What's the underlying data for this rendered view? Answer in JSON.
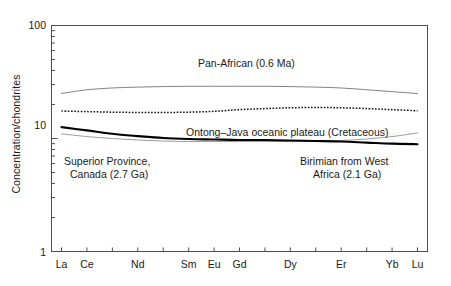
{
  "figure": {
    "ylabel": "Concentration/chondrites",
    "ytick_labels": [
      "100",
      "10",
      "1"
    ],
    "xtick_labels": [
      "La",
      "Ce",
      "Nd",
      "Sm",
      "Eu",
      "Gd",
      "Dy",
      "Er",
      "Yb",
      "Lu"
    ]
  },
  "annotations": {
    "pan_african": "Pan-African (0.6 Ma)",
    "ontong_java": "Ontong–Java oceanic plateau (Cretaceous)",
    "superior_line1": "Superior Province,",
    "superior_line2": "Canada (2.7 Ga)",
    "birimian_line1": "Birimian from West",
    "birimian_line2": "Africa (2.1 Ga)"
  },
  "colors": {
    "frame": "#4a4f55",
    "text": "#1a1a1a",
    "pan_african": "#6f767e",
    "ontong_java": "#111111",
    "superior": "#8a9197",
    "birimian": "#000000"
  },
  "chart_data": {
    "type": "line",
    "title": "",
    "xlabel": "",
    "ylabel": "Concentration/chondrites",
    "yscale": "log",
    "ylim": [
      1,
      100
    ],
    "grid": false,
    "legend": "inline-annotations",
    "categories": [
      "La",
      "Ce",
      "Pr",
      "Nd",
      "Pm",
      "Sm",
      "Eu",
      "Gd",
      "Tb",
      "Dy",
      "Ho",
      "Er",
      "Tm",
      "Yb",
      "Lu"
    ],
    "tick_labelled": [
      "La",
      "Ce",
      "Nd",
      "Sm",
      "Eu",
      "Gd",
      "Dy",
      "Er",
      "Yb",
      "Lu"
    ],
    "series": [
      {
        "name": "Pan-African (0.6 Ma)",
        "style": "thin-solid",
        "values": [
          25.0,
          27.0,
          28.0,
          28.5,
          28.8,
          29.0,
          29.0,
          29.0,
          29.0,
          28.8,
          28.5,
          28.0,
          27.0,
          26.0,
          25.0
        ]
      },
      {
        "name": "Ontong–Java oceanic plateau (Cretaceous)",
        "style": "dotted",
        "values": [
          17.5,
          17.3,
          17.1,
          17.0,
          17.0,
          17.1,
          17.4,
          18.0,
          18.4,
          18.7,
          18.8,
          18.7,
          18.4,
          18.0,
          17.6
        ]
      },
      {
        "name": "Superior Province, Canada (2.7 Ga)",
        "style": "thin-solid",
        "values": [
          11.0,
          10.4,
          10.0,
          9.7,
          9.5,
          9.4,
          9.4,
          9.4,
          9.4,
          9.4,
          9.5,
          9.6,
          9.9,
          10.4,
          11.2
        ]
      },
      {
        "name": "Birimian from West Africa (2.1 Ga)",
        "style": "thick-solid",
        "values": [
          12.6,
          11.8,
          11.0,
          10.5,
          10.1,
          9.9,
          9.8,
          9.7,
          9.7,
          9.6,
          9.5,
          9.4,
          9.2,
          9.0,
          8.9
        ]
      }
    ]
  }
}
